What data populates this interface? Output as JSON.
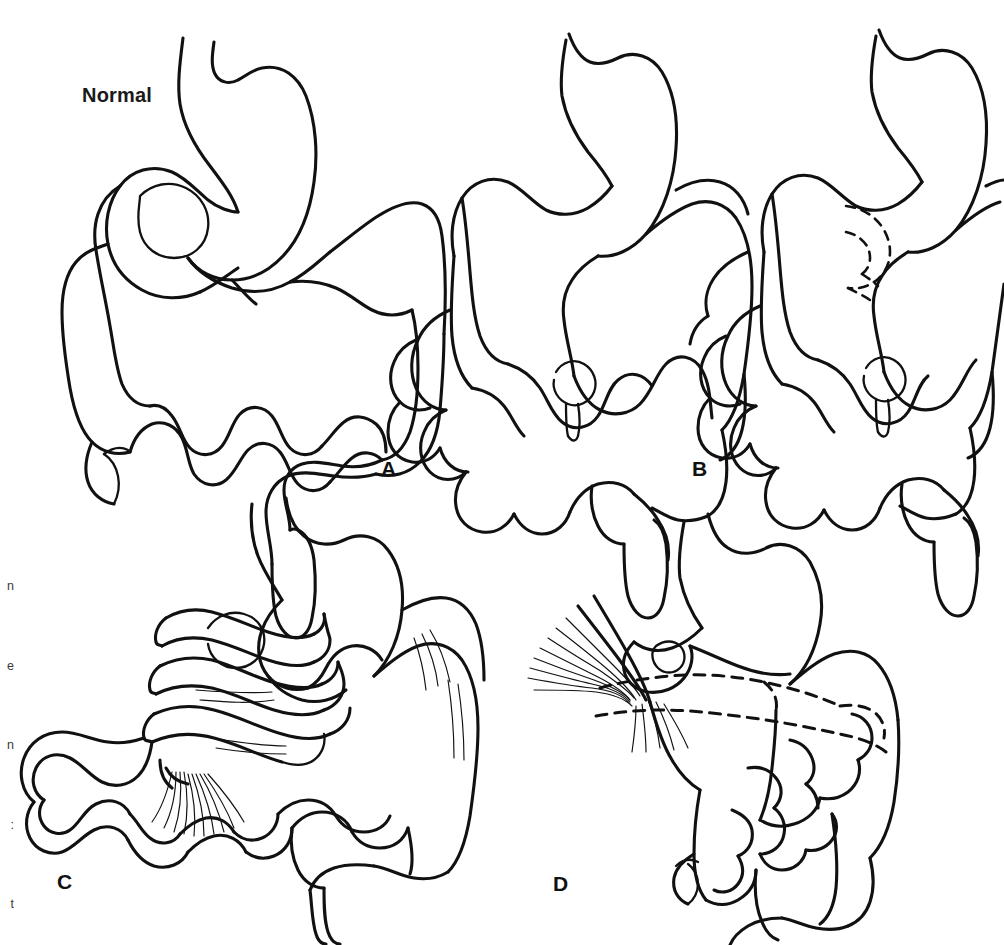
{
  "figure": {
    "type": "medical-line-illustration",
    "background_color": "#ffffff",
    "line_color": "#111111",
    "panels": [
      {
        "id": "normal",
        "label": "Normal",
        "label_position": "top-left",
        "description": "Normal intestinal rotation: stomach, C-loop of duodenum crossing midline, duodenojejunal junction to the left of the spine, small bowel filling the central abdomen, colon framing the periphery with cecum in the right lower quadrant and appendix.",
        "structures": [
          "stomach",
          "duodenum",
          "duodenojejunal-junction",
          "jejunum",
          "ileum",
          "ascending-colon",
          "transverse-colon",
          "descending-colon",
          "cecum",
          "appendix",
          "rectum"
        ],
        "has_dashed_overlay": false,
        "has_mesenteric_fan": false
      },
      {
        "id": "a",
        "label": "A",
        "label_position": "bottom-left",
        "description": "Nonrotation: duodenum descends to the right of midline without crossing, small bowel lies on the right side of the abdomen and colon on the left, with a narrow mesenteric base.",
        "structures": [
          "stomach",
          "duodenum",
          "small-bowel-loops",
          "colon",
          "cecum",
          "appendix"
        ],
        "has_dashed_overlay": false,
        "has_mesenteric_fan": false
      },
      {
        "id": "b",
        "label": "B",
        "label_position": "bottom-left",
        "description": "Incomplete rotation with a retroperitoneal/hidden duodenal segment shown as a dashed U-shaped loop behind the superior mesenteric vessels.",
        "structures": [
          "stomach",
          "duodenum",
          "hidden-duodenal-loop",
          "small-bowel-loops",
          "colon",
          "cecum",
          "appendix"
        ],
        "has_dashed_overlay": true,
        "dashed_overlay_meaning": "duodenal segment lying posterior (hidden) behind the mesenteric root",
        "has_mesenteric_fan": false
      },
      {
        "id": "c",
        "label": "C",
        "label_position": "bottom-left",
        "description": "Midgut volvulus: the narrow mesenteric pedicle twists clockwise on itself producing several coils of bowel around the superior mesenteric axis, with the fanned mesentery converging at the twist.",
        "structures": [
          "stomach",
          "duodenum",
          "volvulus-twist-coils",
          "mesentery-fan",
          "small-bowel-loops",
          "colon",
          "cecum",
          "appendix"
        ],
        "has_dashed_overlay": false,
        "has_mesenteric_fan": true,
        "volvulus_coil_count": 3
      },
      {
        "id": "d",
        "label": "D",
        "label_position": "bottom-left",
        "description": "Ladd's bands: fibrous peritoneal bands sweep from the right posterolateral abdominal wall across the duodenum (shown dashed where it passes beneath them) to the malpositioned cecum, causing extrinsic duodenal obstruction.",
        "structures": [
          "stomach",
          "duodenum",
          "ladd-bands",
          "cecum",
          "small-bowel-loops",
          "colon",
          "appendix"
        ],
        "has_dashed_overlay": true,
        "dashed_overlay_meaning": "duodenum coursing beneath the obstructing Ladd's bands",
        "has_mesenteric_fan": true
      }
    ]
  },
  "labels": {
    "normal": "Normal",
    "a": "A",
    "b": "B",
    "c": "C",
    "d": "D"
  },
  "caption_fragment_lines": [
    "n",
    "e",
    "n",
    ":",
    "t",
    "v",
    "d",
    ".",
    "d",
    ".",
    "s",
    "d",
    "ll",
    "g"
  ]
}
